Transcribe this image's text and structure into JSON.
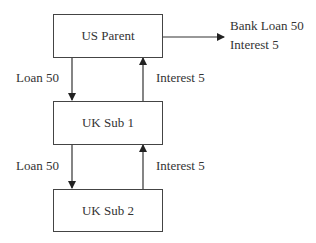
{
  "diagram": {
    "nodes": [
      {
        "id": "us_parent",
        "label": "US Parent"
      },
      {
        "id": "uk_sub_1",
        "label": "UK Sub 1"
      },
      {
        "id": "uk_sub_2",
        "label": "UK Sub 2"
      }
    ],
    "edges": [
      {
        "from": "us_parent",
        "to": "uk_sub_1",
        "label": "Loan 50"
      },
      {
        "from": "uk_sub_1",
        "to": "us_parent",
        "label": "Interest 5"
      },
      {
        "from": "uk_sub_1",
        "to": "uk_sub_2",
        "label": "Loan 50"
      },
      {
        "from": "uk_sub_2",
        "to": "uk_sub_1",
        "label": "Interest 5"
      },
      {
        "from": "us_parent",
        "to": "external",
        "label": "Bank Loan 50"
      }
    ],
    "external_labels": [
      "Bank Loan 50",
      "Interest 5"
    ]
  }
}
